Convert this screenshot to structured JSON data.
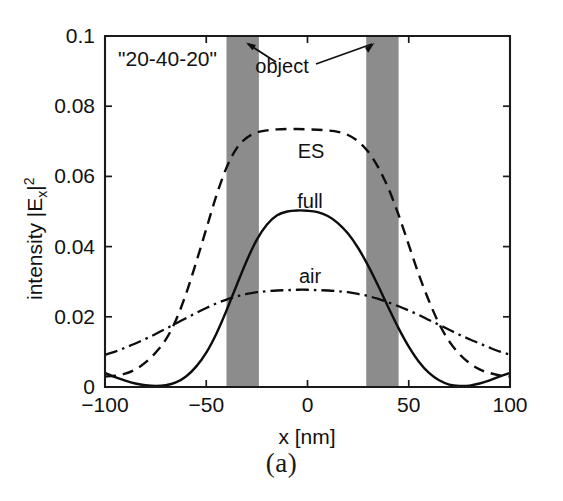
{
  "figure": {
    "caption": "(a)",
    "inline_title": "\"20-40-20\""
  },
  "axes": {
    "x_label": "x [nm]",
    "y_label_main": "intensity |E",
    "y_label_sub": "x",
    "y_label_close": "|",
    "y_label_sup": "2",
    "x_ticks": [
      "-100",
      "-50",
      "0",
      "50",
      "100"
    ],
    "y_ticks": [
      "0",
      "0.02",
      "0.04",
      "0.06",
      "0.08",
      "0.1"
    ]
  },
  "annotations": {
    "object": "object",
    "es": "ES",
    "full": "full",
    "air": "air"
  },
  "colors": {
    "object_fill": "#8c8c8c",
    "curve": "#0d0d0d",
    "axis": "#1a1a1a",
    "background": "#ffffff"
  },
  "chart_data": {
    "type": "line",
    "title": "\"20-40-20\"",
    "xlabel": "x [nm]",
    "ylabel": "intensity |Ex|^2",
    "xlim": [
      -100,
      100
    ],
    "ylim": [
      0,
      0.1
    ],
    "xticks": [
      -100,
      -50,
      0,
      50,
      100
    ],
    "yticks": [
      0,
      0.02,
      0.04,
      0.06,
      0.08,
      0.1
    ],
    "grid": false,
    "legend": "inline-labels",
    "x": [
      -100,
      -95,
      -90,
      -85,
      -80,
      -75,
      -70,
      -65,
      -60,
      -55,
      -50,
      -45,
      -40,
      -35,
      -30,
      -25,
      -20,
      -15,
      -10,
      -5,
      0,
      5,
      10,
      15,
      20,
      25,
      30,
      35,
      40,
      45,
      50,
      55,
      60,
      65,
      70,
      75,
      80,
      85,
      90,
      95,
      100
    ],
    "series": [
      {
        "name": "ES",
        "style": "dashed",
        "values": [
          0.003,
          0.0032,
          0.0038,
          0.005,
          0.007,
          0.0098,
          0.0135,
          0.019,
          0.0265,
          0.0355,
          0.045,
          0.0545,
          0.0625,
          0.068,
          0.071,
          0.0725,
          0.0731,
          0.0734,
          0.0735,
          0.0735,
          0.0734,
          0.0733,
          0.0731,
          0.0727,
          0.0718,
          0.07,
          0.067,
          0.0625,
          0.0565,
          0.049,
          0.0405,
          0.032,
          0.0245,
          0.018,
          0.013,
          0.0094,
          0.0068,
          0.005,
          0.004,
          0.0033,
          0.003
        ]
      },
      {
        "name": "full",
        "style": "solid",
        "values": [
          0.004,
          0.0028,
          0.0018,
          0.001,
          0.0005,
          0.0003,
          0.0005,
          0.0013,
          0.003,
          0.0058,
          0.0098,
          0.0152,
          0.0218,
          0.029,
          0.036,
          0.042,
          0.0463,
          0.0489,
          0.05,
          0.0503,
          0.0502,
          0.0498,
          0.0487,
          0.0467,
          0.0437,
          0.0396,
          0.0345,
          0.0287,
          0.0226,
          0.0167,
          0.0115,
          0.0072,
          0.004,
          0.0019,
          0.0007,
          0.0003,
          0.0004,
          0.001,
          0.0019,
          0.003,
          0.004
        ]
      },
      {
        "name": "air",
        "style": "dash-dot",
        "values": [
          0.0092,
          0.0101,
          0.0112,
          0.0124,
          0.0137,
          0.0151,
          0.0166,
          0.0181,
          0.0196,
          0.0211,
          0.0225,
          0.0238,
          0.0249,
          0.0258,
          0.0265,
          0.027,
          0.0273,
          0.0275,
          0.0276,
          0.0277,
          0.0277,
          0.0276,
          0.0275,
          0.0273,
          0.027,
          0.0265,
          0.0259,
          0.0251,
          0.0241,
          0.023,
          0.0218,
          0.0205,
          0.0191,
          0.0177,
          0.0163,
          0.0149,
          0.0136,
          0.0124,
          0.0112,
          0.0101,
          0.0092
        ]
      }
    ],
    "shaded_regions": [
      {
        "name": "object-bar-left",
        "x_start": -40,
        "x_end": -24,
        "label": "object"
      },
      {
        "name": "object-bar-right",
        "x_start": 29,
        "x_end": 45,
        "label": "object"
      }
    ]
  }
}
